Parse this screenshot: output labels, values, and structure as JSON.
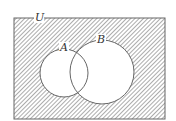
{
  "diagram": {
    "type": "venn",
    "universe_label": "U",
    "sets": [
      {
        "label": "A"
      },
      {
        "label": "B"
      }
    ],
    "shaded_region": "complement of (A ∪ B)",
    "colors": {
      "stroke": "#666666",
      "hatch": "#888888",
      "background": "#ffffff"
    }
  }
}
